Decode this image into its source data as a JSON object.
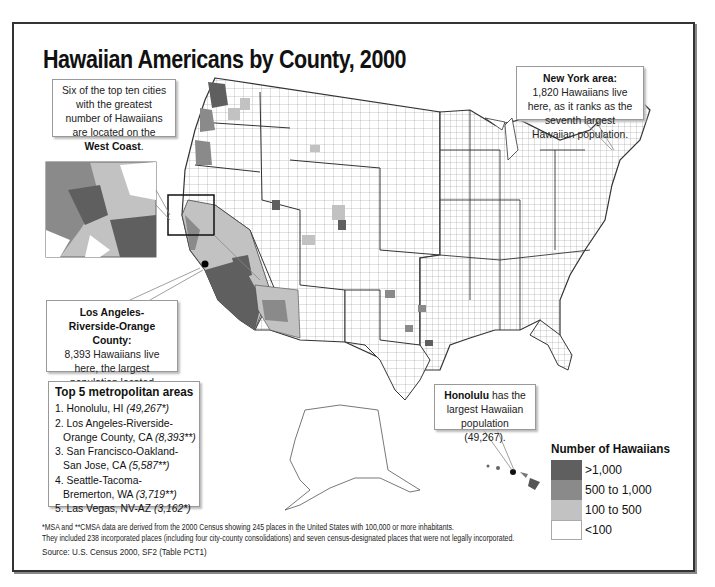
{
  "title": "Hawaiian Americans by County, 2000",
  "callouts": {
    "west_coast": {
      "text_before": "Six of the top ten cities with the greatest number of Hawaiians are located on the ",
      "text_bold": "West Coast",
      "text_after": "."
    },
    "new_york": {
      "heading": "New York area:",
      "body": "1,820 Hawaiians live here, as it ranks as the seventh largest Hawaiian population."
    },
    "los_angeles": {
      "heading": "Los Angeles-Riverside-Orange County:",
      "body": "8,393 Hawaiians live here, the largest population located outside of Hawai‘i."
    },
    "honolulu": {
      "bold": "Honolulu",
      "body": " has the largest Hawaiian population (49,267)."
    }
  },
  "top5": {
    "heading": "Top 5 metropolitan areas",
    "items": [
      {
        "rank": "1.",
        "name": "Honolulu, HI",
        "name_cont": "",
        "value": "(49,267*)"
      },
      {
        "rank": "2.",
        "name": "Los Angeles-Riverside-",
        "name_cont": "Orange County, CA",
        "value": "(8,393**)"
      },
      {
        "rank": "3.",
        "name": "San Francisco-Oakland-",
        "name_cont": "San Jose, CA",
        "value": "(5,587**)"
      },
      {
        "rank": "4.",
        "name": "Seattle-Tacoma-",
        "name_cont": "Bremerton, WA",
        "value": "(3,719**)"
      },
      {
        "rank": "5.",
        "name": "Las Vegas, NV-AZ",
        "name_cont": "",
        "value": "(3,162*)"
      }
    ]
  },
  "legend": {
    "title": "Number of Hawaiians",
    "items": [
      {
        "label": ">1,000",
        "color": "#5f5f5f"
      },
      {
        "label": "500 to 1,000",
        "color": "#8a8a8a"
      },
      {
        "label": "100 to 500",
        "color": "#c2c2c2"
      },
      {
        "label": "<100",
        "color": "#ffffff"
      }
    ]
  },
  "footnote": {
    "line1": "*MSA and **CMSA data are derived from the 2000 Census showing 245 places in the United States with 100,000 or more inhabitants.",
    "line2": "They included 238 incorporated places (including four city-county consolidations) and seven census-designated places that were not legally incorporated."
  },
  "source": "Source: U.S. Census 2000, SF2 (Table PCT1)",
  "colors": {
    "high": "#5f5f5f",
    "mid": "#8a8a8a",
    "low": "#c2c2c2",
    "none": "#ffffff",
    "border": "#444444"
  }
}
